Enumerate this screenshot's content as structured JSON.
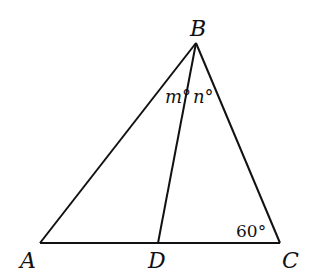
{
  "diagram": {
    "points": {
      "A": {
        "label": "A",
        "x": 40,
        "y": 243
      },
      "B": {
        "label": "B",
        "x": 196,
        "y": 43
      },
      "C": {
        "label": "C",
        "x": 280,
        "y": 243
      },
      "D": {
        "label": "D",
        "x": 158,
        "y": 243
      }
    },
    "segments": [
      "AB",
      "BC",
      "AC",
      "BD"
    ],
    "angles": {
      "ABD": "m°",
      "DBC": "n°",
      "BCA": "60°"
    }
  }
}
